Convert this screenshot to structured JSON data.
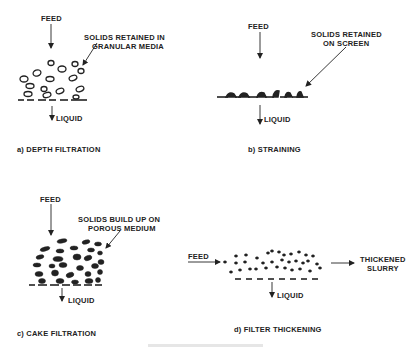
{
  "panels": {
    "a": {
      "feed": "FEED",
      "annotation_line1": "SOLIDS RETAINED IN",
      "annotation_line2": "GRANULAR MEDIA",
      "liquid": "LIQUID",
      "caption": "a)  DEPTH FILTRATION"
    },
    "b": {
      "feed": "FEED",
      "annotation_line1": "SOLIDS RETAINED",
      "annotation_line2": "ON SCREEN",
      "liquid": "LIQUID",
      "caption": "b)  STRAINING"
    },
    "c": {
      "feed": "FEED",
      "annotation_line1": "SOLIDS BUILD UP ON",
      "annotation_line2": "POROUS MEDIUM",
      "liquid": "LIQUID",
      "caption": "c)  CAKE FILTRATION"
    },
    "d": {
      "feed": "FEED",
      "output_line1": "THICKENED",
      "output_line2": "SLURRY",
      "liquid": "LIQUID",
      "caption": "d)  FILTER THICKENING"
    }
  },
  "colors": {
    "ink": "#222222",
    "background": "#ffffff"
  }
}
